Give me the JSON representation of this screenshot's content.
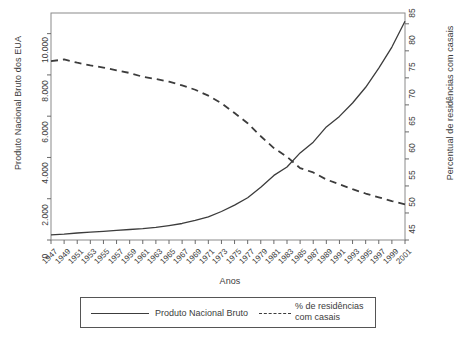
{
  "chart_data": {
    "type": "line",
    "title": "",
    "xlabel": "Anos",
    "ylabel_left": "Produto Nacional Bruto dos EUA",
    "ylabel_right": "Percentual de residências com casais",
    "grid": false,
    "legend_position": "bottom",
    "x": [
      1947,
      1949,
      1951,
      1953,
      1955,
      1957,
      1959,
      1961,
      1963,
      1965,
      1967,
      1969,
      1971,
      1973,
      1975,
      1977,
      1979,
      1981,
      1983,
      1985,
      1987,
      1989,
      1991,
      1993,
      1995,
      1997,
      1999,
      2001
    ],
    "xtick_labels": [
      "1947",
      "1949",
      "1951",
      "1953",
      "1955",
      "1957",
      "1959",
      "1961",
      "1963",
      "1965",
      "1967",
      "1969",
      "1971",
      "1973",
      "1975",
      "1977",
      "1979",
      "1981",
      "1983",
      "1985",
      "1987",
      "1989",
      "1991",
      "1993",
      "1995",
      "1997",
      "1999",
      "2001"
    ],
    "ylim_left": [
      0,
      11000
    ],
    "ytick_values_left": [
      0,
      2000,
      4000,
      6000,
      8000,
      10000
    ],
    "ytick_labels_left": [
      "0",
      "2.000",
      "4.000",
      "6.000",
      "8.000",
      "10.000"
    ],
    "ylim_right": [
      45,
      87
    ],
    "ytick_values_right": [
      45,
      50,
      55,
      60,
      65,
      70,
      75,
      80,
      85
    ],
    "ytick_labels_right": [
      "45",
      "50",
      "55",
      "60",
      "65",
      "70",
      "75",
      "80",
      "85"
    ],
    "series": [
      {
        "name": "Produto Nacional Bruto",
        "style": "solid",
        "axis": "left",
        "color": "#3c3c3c",
        "values": [
          250,
          280,
          340,
          380,
          420,
          470,
          510,
          550,
          610,
          700,
          800,
          950,
          1120,
          1380,
          1690,
          2050,
          2560,
          3130,
          3540,
          4220,
          4740,
          5480,
          5990,
          6640,
          7400,
          8330,
          9350,
          10600
        ]
      },
      {
        "name": "% de residências com casais",
        "style": "dashed",
        "axis": "right",
        "color": "#3c3c3c",
        "values": [
          78.1,
          78.4,
          77.8,
          77.3,
          76.9,
          76.4,
          75.9,
          75.2,
          74.8,
          74.3,
          73.6,
          72.8,
          71.7,
          70.3,
          68.5,
          66.6,
          64.2,
          62.0,
          60.4,
          58.3,
          57.5,
          56.2,
          55.3,
          54.4,
          53.6,
          52.9,
          52.2,
          51.6
        ]
      }
    ],
    "legend": [
      {
        "label": "Produto Nacional Bruto",
        "style": "solid"
      },
      {
        "label": "% de residências com casais",
        "style": "dashed"
      }
    ]
  },
  "caption": ""
}
